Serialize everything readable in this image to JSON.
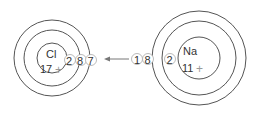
{
  "diagram": {
    "chlorine": {
      "symbol": "Cl",
      "nuclear_charge": "17",
      "charge_sign": "+",
      "shells": [
        "2",
        "8",
        "7"
      ]
    },
    "sodium": {
      "symbol": "Na",
      "nuclear_charge": "11",
      "charge_sign": "+",
      "shells": [
        "2",
        "8",
        "1"
      ]
    },
    "arrow": {
      "direction": "left",
      "from": "Na",
      "to": "Cl"
    }
  }
}
